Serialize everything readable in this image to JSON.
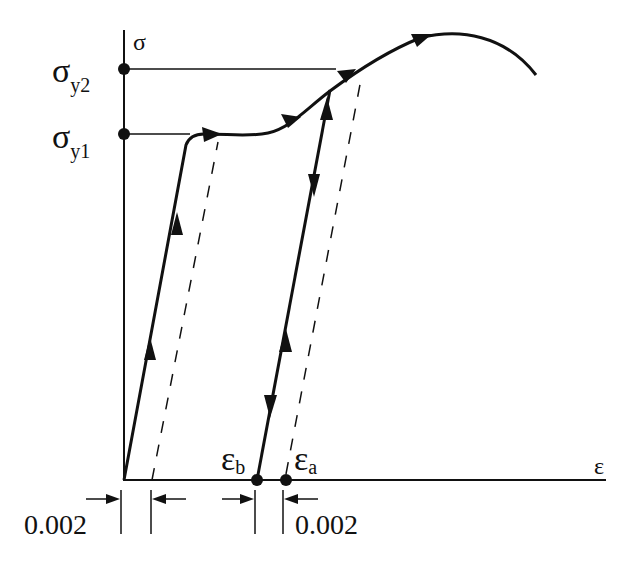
{
  "axes": {
    "y_label": "σ",
    "x_label": "ε"
  },
  "yield_points": [
    {
      "symbol": "σ",
      "subscript": "y2"
    },
    {
      "symbol": "σ",
      "subscript": "y1"
    }
  ],
  "strain_points": [
    {
      "symbol": "ε",
      "subscript": "b"
    },
    {
      "symbol": "ε",
      "subscript": "a"
    }
  ],
  "offsets": [
    {
      "label": "0.002"
    },
    {
      "label": "0.002"
    }
  ],
  "colors": {
    "line": "#111111",
    "background": "#ffffff"
  }
}
